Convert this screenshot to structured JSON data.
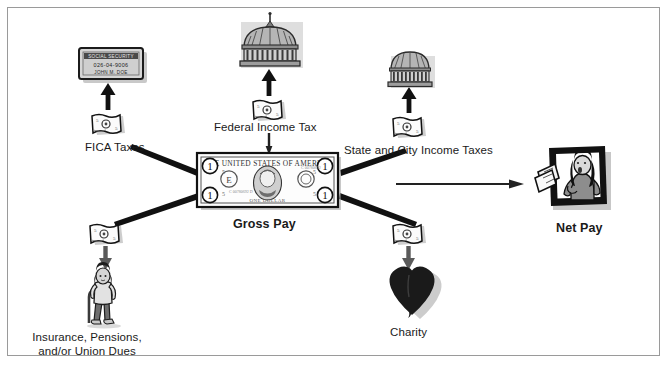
{
  "diagram": {
    "frame_color": "#9a9a9a",
    "background": "#ffffff",
    "ink": "#1a1a1a",
    "nodes": {
      "gross_pay": {
        "label": "Gross Pay",
        "icon": "dollar-bill-icon",
        "bill_text_top": "THE UNITED STATES OF AMERICA",
        "bill_text_bottom": "ONE DOLLAR",
        "bill_corner_value": "1",
        "bill_letter": "E"
      },
      "net_pay": {
        "label": "Net Pay",
        "icon": "person-holding-cash-icon"
      },
      "fica": {
        "label": "FICA Taxes",
        "icon": "social-security-card-icon",
        "card_title": "SOCIAL SECURITY",
        "card_number": "026-04-9006",
        "card_name": "JOHN M. DOE",
        "money_icon": "crumpled-bill-icon"
      },
      "federal": {
        "label": "Federal Income Tax",
        "icon": "capitol-dome-icon",
        "money_icon": "crumpled-bill-icon"
      },
      "state_city": {
        "label": "State and City Income Taxes",
        "icon": "state-capitol-dome-icon",
        "money_icon": "crumpled-bill-icon"
      },
      "insurance": {
        "label_line1": "Insurance, Pensions,",
        "label_line2": "and/or Union Dues",
        "icon": "person-with-cane-icon",
        "money_icon": "crumpled-bill-icon"
      },
      "charity": {
        "label": "Charity",
        "icon": "heart-icon",
        "money_icon": "crumpled-bill-icon"
      }
    },
    "edges": [
      {
        "from": "gross_pay",
        "to": "fica",
        "style": "thick-tapered"
      },
      {
        "from": "gross_pay",
        "to": "federal",
        "style": "thin-vertical"
      },
      {
        "from": "gross_pay",
        "to": "state_city",
        "style": "thick-tapered"
      },
      {
        "from": "gross_pay",
        "to": "insurance",
        "style": "thick-tapered"
      },
      {
        "from": "gross_pay",
        "to": "charity",
        "style": "thick-tapered"
      },
      {
        "from": "gross_pay",
        "to": "net_pay",
        "style": "thin-arrow"
      },
      {
        "from": "fica_money",
        "to": "social_security_card",
        "style": "black-arrow-up"
      },
      {
        "from": "federal_money",
        "to": "capitol_dome",
        "style": "black-arrow-up"
      },
      {
        "from": "state_money",
        "to": "state_dome",
        "style": "black-arrow-up"
      },
      {
        "from": "insurance_money",
        "to": "person_with_cane",
        "style": "gray-arrow-down"
      },
      {
        "from": "charity_money",
        "to": "heart",
        "style": "gray-arrow-down"
      }
    ]
  }
}
